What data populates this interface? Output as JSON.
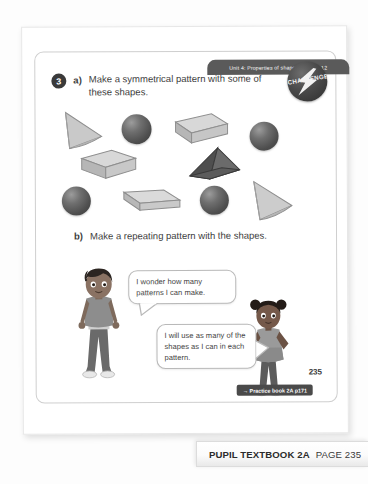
{
  "page": {
    "unit_banner": "Unit 4: Properties of shapes, Lesson 12",
    "page_number": "235"
  },
  "question": {
    "number": "3",
    "part_a_letter": "a)",
    "part_a_text": "Make a symmetrical pattern with some of these shapes.",
    "part_b_letter": "b)",
    "part_b_text": "Make a repeating pattern with the shapes."
  },
  "challenge_badge": {
    "label": "CHALLENGE",
    "icon": "lightning-bolt-icon",
    "color": "#2e2e2e"
  },
  "shapes": [
    {
      "id": "cone-1",
      "type": "cone",
      "tone": "light"
    },
    {
      "id": "sphere-1",
      "type": "sphere",
      "tone": "dark"
    },
    {
      "id": "cuboid-1",
      "type": "cuboid",
      "tone": "light"
    },
    {
      "id": "sphere-2",
      "type": "sphere",
      "tone": "dark"
    },
    {
      "id": "cuboid-2",
      "type": "cuboid",
      "tone": "light"
    },
    {
      "id": "triangular-prism-1",
      "type": "triangular-prism",
      "tone": "dark"
    },
    {
      "id": "sphere-3",
      "type": "sphere",
      "tone": "dark"
    },
    {
      "id": "cuboid-slab-1",
      "type": "cuboid",
      "tone": "light"
    },
    {
      "id": "sphere-4",
      "type": "sphere",
      "tone": "dark"
    },
    {
      "id": "cone-2",
      "type": "cone",
      "tone": "light"
    }
  ],
  "characters": [
    {
      "id": "boy",
      "name": "boy-character"
    },
    {
      "id": "girl",
      "name": "girl-character"
    }
  ],
  "speech_bubbles": [
    {
      "id": "bubble-boy",
      "text": "I wonder how many patterns I can make."
    },
    {
      "id": "bubble-girl",
      "text": "I will use as many of the shapes as I can in each pattern."
    }
  ],
  "footer": {
    "practice_tag": "→ Practice book 2A p171",
    "caption_strong": "PUPIL TEXTBOOK 2A",
    "caption_light": "PAGE 235"
  }
}
